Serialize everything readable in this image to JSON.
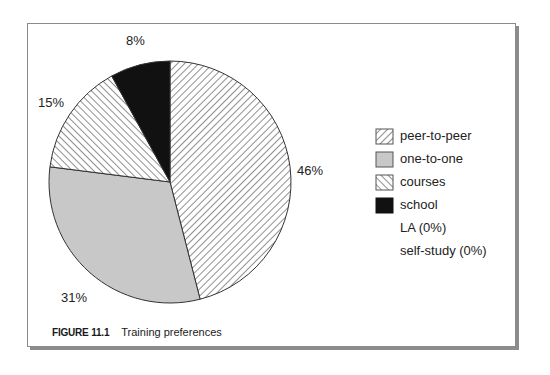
{
  "chart_data": {
    "type": "pie",
    "title": "Training preferences",
    "figure_label": "FIGURE 11.1",
    "categories": [
      "peer-to-peer",
      "one-to-one",
      "courses",
      "school",
      "LA",
      "self-study"
    ],
    "values": [
      46,
      31,
      15,
      8,
      0,
      0
    ],
    "unit": "%",
    "data_labels": [
      "46%",
      "31%",
      "15%",
      "8%"
    ],
    "fills": {
      "peer-to-peer": "hatch-forward",
      "one-to-one": "#c8c8c8",
      "courses": "hatch-backward",
      "school": "#111111"
    },
    "legend_position": "right",
    "start_angle": "12 o'clock, clockwise"
  },
  "legend": {
    "items": [
      {
        "label": "peer-to-peer",
        "swatch": "hatch-forward"
      },
      {
        "label": "one-to-one",
        "swatch": "#c8c8c8"
      },
      {
        "label": "courses",
        "swatch": "hatch-backward"
      },
      {
        "label": "school",
        "swatch": "#111111"
      },
      {
        "label": "LA (0%)",
        "swatch": null
      },
      {
        "label": "self-study (0%)",
        "swatch": null
      }
    ]
  },
  "labels": {
    "peer": "46%",
    "one": "31%",
    "courses": "15%",
    "school": "8%"
  },
  "caption": {
    "number": "FIGURE 11.1",
    "text": "Training preferences"
  }
}
